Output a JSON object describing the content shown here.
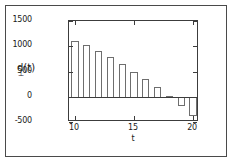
{
  "chart_data": {
    "type": "bar",
    "title": "",
    "xlabel": "t",
    "ylabel": "d(t)",
    "ylabel_subscript": "⊥",
    "x": [
      10,
      11,
      12,
      13,
      14,
      15,
      16,
      17,
      18,
      19,
      20
    ],
    "values": [
      1100,
      1020,
      900,
      780,
      650,
      500,
      350,
      190,
      20,
      -180,
      -380
    ],
    "categories": [
      "10",
      "11",
      "12",
      "13",
      "14",
      "15",
      "16",
      "17",
      "18",
      "19",
      "20"
    ],
    "xlim": [
      9.5,
      20.5
    ],
    "ylim": [
      -500,
      1500
    ],
    "yticks": [
      1500,
      1000,
      500,
      0,
      -500
    ],
    "ytick_labels": [
      "1500",
      "1000",
      "500",
      "0",
      "-500"
    ],
    "xticks": [
      10,
      15,
      20
    ],
    "xtick_labels": [
      "10",
      "15",
      "20"
    ],
    "grid": false,
    "legend": null,
    "bar_fill": "#ffffff",
    "bar_edge": "#6e6e6e",
    "axis_color": "#3c3c3c",
    "background": "#ffffff"
  }
}
